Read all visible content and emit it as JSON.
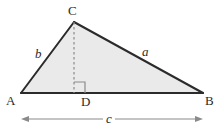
{
  "figure": {
    "type": "geometry-diagram",
    "background_color": "#ffffff",
    "fill_color": "#eaeaea",
    "stroke_color": "#2b2b2b",
    "dash_color": "#8a8a8a",
    "arrow_color": "#8a8a8a",
    "labels": {
      "vertex_c": "C",
      "vertex_a": "A",
      "vertex_b": "B",
      "foot_d": "D",
      "side_b": "b",
      "side_a": "a",
      "side_c": "c"
    },
    "geometry": {
      "points": {
        "A": [
          21,
          93
        ],
        "B": [
          203,
          93
        ],
        "C": [
          74,
          22
        ],
        "D": [
          74,
          93
        ]
      },
      "right_angle_marker": {
        "x": 74,
        "y": 82,
        "size": 11
      },
      "dimension_arrow": {
        "y": 119,
        "x_start": 21,
        "x_end": 203,
        "label": "c"
      }
    }
  }
}
